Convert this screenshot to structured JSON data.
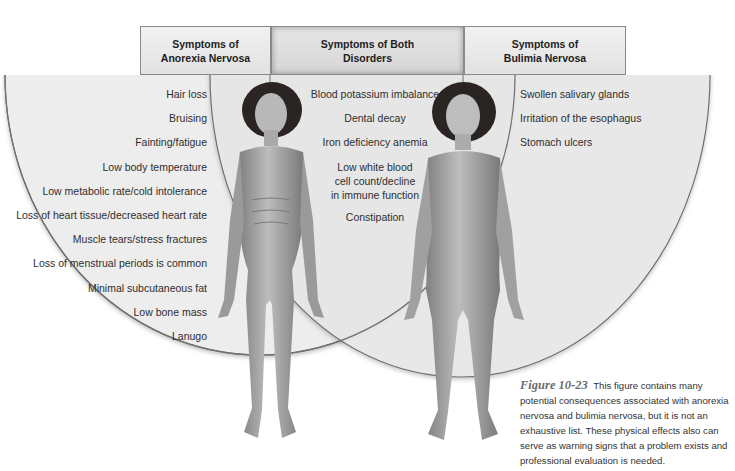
{
  "headers": {
    "anorexia": "Symptoms of\nAnorexia Nervosa",
    "both": "Symptoms of Both\nDisorders",
    "bulimia": "Symptoms of\nBulimia Nervosa"
  },
  "anorexia_symptoms": [
    "Hair loss",
    "Bruising",
    "Fainting/fatigue",
    "Low body temperature",
    "Low metabolic rate/cold intolerance",
    "Loss of heart tissue/decreased heart rate",
    "Muscle tears/stress fractures",
    "Loss of menstrual periods is common",
    "Minimal subcutaneous fat",
    "Low bone mass",
    "Lanugo"
  ],
  "both_symptoms": [
    "Blood potassium imbalance",
    "Dental decay",
    "Iron deficiency anemia",
    "Low white blood\ncell count/decline\nin immune function",
    "Constipation"
  ],
  "bulimia_symptoms": [
    "Swollen salivary glands",
    "Irritation of the esophagus",
    "Stomach ulcers"
  ],
  "figures": {
    "left": "anorexic-body-illustration",
    "right": "bulimic-body-illustration"
  },
  "caption": {
    "label": "Figure 10-23",
    "text": "This figure contains many potential consequences associated with anorexia nervosa and bulimia nervosa, but it is not an exhaustive list. These physical effects also can serve as warning signs that a problem exists and professional evaluation is needed."
  },
  "colors": {
    "region_fill": "#ececec",
    "region_stroke": "#6f6f6f",
    "header_border": "#8a8a8a"
  }
}
